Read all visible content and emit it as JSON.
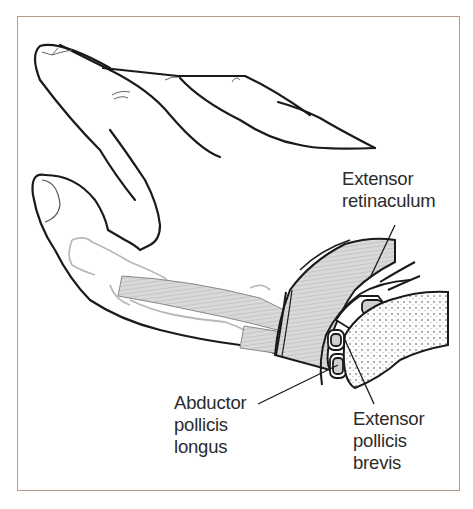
{
  "figure": {
    "labels": {
      "extensor_retinaculum": [
        "Extensor",
        "retinaculum"
      ],
      "abductor_pollicis_longus": [
        "Abductor",
        "pollicis",
        "longus"
      ],
      "extensor_pollicis_brevis": [
        "Extensor",
        "pollicis",
        "brevis"
      ]
    },
    "colors": {
      "frame": "#b49a8a",
      "outline": "#1a1a1a",
      "bone": "#b8b8b8",
      "tendon_fill": "#d6d6d6",
      "text": "#2b2b2b"
    }
  }
}
